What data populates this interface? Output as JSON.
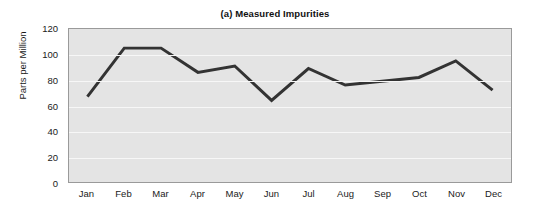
{
  "chart_data": {
    "type": "line",
    "title": "(a) Measured Impurities",
    "xlabel": "",
    "ylabel": "Parts per Million",
    "categories": [
      "Jan",
      "Feb",
      "Mar",
      "Apr",
      "May",
      "Jun",
      "Jul",
      "Aug",
      "Sep",
      "Oct",
      "Nov",
      "Dec"
    ],
    "values": [
      67,
      105,
      105,
      86,
      91,
      64,
      89,
      76,
      79,
      82,
      95,
      72
    ],
    "ylim": [
      0,
      120
    ],
    "yticks": [
      0,
      20,
      40,
      60,
      80,
      100,
      120
    ],
    "ytick_labels": [
      "0",
      "20",
      "40",
      "60",
      "80",
      "100",
      "120"
    ],
    "grid": true,
    "legend": false,
    "series": [
      {
        "name": "Measured Impurities",
        "values": [
          67,
          105,
          105,
          86,
          91,
          64,
          89,
          76,
          79,
          82,
          95,
          72
        ]
      }
    ],
    "colors": {
      "line": "#333333",
      "plot_background": "#e4e4e4",
      "gridline": "#f7f7f7",
      "plot_border": "#9a9a9a",
      "figure_background": "#ffffff",
      "text": "#1a1a1a"
    }
  }
}
